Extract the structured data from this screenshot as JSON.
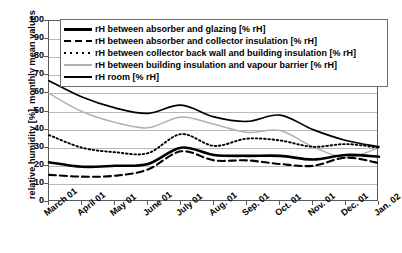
{
  "chart_data": {
    "type": "line",
    "title": "",
    "xlabel": "",
    "ylabel": "relative humidity [%], monthly mean values",
    "ylim": [
      0,
      100
    ],
    "ytick_step": 10,
    "grid": true,
    "legend_position": "top-inside",
    "categories": [
      "March 01",
      "April 01",
      "May 01",
      "June 01",
      "July 01",
      "Aug. 01",
      "Sep. 01",
      "Oct. 01",
      "Nov. 01",
      "Dec. 01",
      "Jan. 02"
    ],
    "yticks": [
      "0",
      "10",
      "20",
      "30",
      "40",
      "50",
      "60",
      "70",
      "80",
      "90",
      "100"
    ],
    "series": [
      {
        "name": "rH between absorber and glazing [% rH]",
        "style": "thick-solid-black",
        "color": "#000000",
        "values": [
          22,
          19.5,
          20,
          21,
          30,
          26,
          25.5,
          25.5,
          23.5,
          26,
          25
        ]
      },
      {
        "name": "rH between absorber and collector insulation [% rH]",
        "style": "dashed-black",
        "color": "#000000",
        "values": [
          15,
          14,
          14.5,
          18,
          28,
          23,
          23,
          21,
          20,
          24.5,
          21.5
        ]
      },
      {
        "name": "rH between collector back wall and building insulation [% rH]",
        "style": "dotted-black",
        "color": "#000000",
        "values": [
          37,
          30,
          27.5,
          27,
          37.5,
          31,
          35,
          34,
          30.5,
          32,
          30
        ]
      },
      {
        "name": "rH between building insulation and vapour barrier [% rH]",
        "style": "thin-solid-gray",
        "color": "#b0b0b0",
        "values": [
          60,
          50,
          44,
          41,
          47,
          43,
          38.5,
          39.5,
          30.5,
          24.5,
          30
        ]
      },
      {
        "name": "rH room [% rH]",
        "style": "medium-solid-black",
        "color": "#000000",
        "values": [
          67,
          58,
          52,
          49,
          53.5,
          47,
          44.5,
          48,
          40,
          34,
          30.5
        ]
      }
    ]
  },
  "legend": {
    "items": [
      {
        "label": "rH between absorber and glazing [% rH]"
      },
      {
        "label": "rH between absorber and collector insulation [% rH]"
      },
      {
        "label": "rH between collector back wall and building insulation [% rH]"
      },
      {
        "label": "rH between building insulation and vapour barrier [% rH]"
      },
      {
        "label": "rH room [% rH]"
      }
    ]
  }
}
